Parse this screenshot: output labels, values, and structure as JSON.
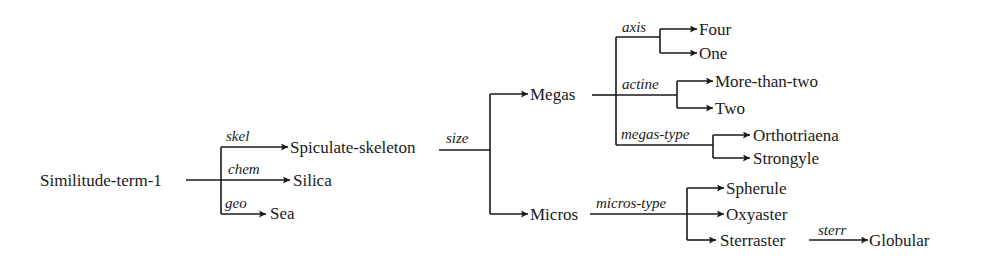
{
  "diagram": {
    "root": "Similitude-term-1",
    "nodes": {
      "root": "Similitude-term-1",
      "spiculate_skeleton": "Spiculate-skeleton",
      "silica": "Silica",
      "sea": "Sea",
      "megas": "Megas",
      "micros": "Micros",
      "four": "Four",
      "one": "One",
      "more_than_two": "More-than-two",
      "two": "Two",
      "orthotriaena": "Orthotriaena",
      "strongyle": "Strongyle",
      "spherule": "Spherule",
      "oxyaster": "Oxyaster",
      "sterraster": "Sterraster",
      "globular": "Globular"
    },
    "edge_labels": {
      "skel": "skel",
      "chem": "chem",
      "geo": "geo",
      "size": "size",
      "axis": "axis",
      "actine": "actine",
      "megas_type": "megas-type",
      "micros_type": "micros-type",
      "sterr": "sterr"
    },
    "edges": [
      {
        "from": "Similitude-term-1",
        "label": "skel",
        "to": "Spiculate-skeleton"
      },
      {
        "from": "Similitude-term-1",
        "label": "chem",
        "to": "Silica"
      },
      {
        "from": "Similitude-term-1",
        "label": "geo",
        "to": "Sea"
      },
      {
        "from": "Spiculate-skeleton",
        "label": "size",
        "to": "Megas"
      },
      {
        "from": "Spiculate-skeleton",
        "label": "size",
        "to": "Micros"
      },
      {
        "from": "Megas",
        "label": "axis",
        "to": "Four"
      },
      {
        "from": "Megas",
        "label": "axis",
        "to": "One"
      },
      {
        "from": "Megas",
        "label": "actine",
        "to": "More-than-two"
      },
      {
        "from": "Megas",
        "label": "actine",
        "to": "Two"
      },
      {
        "from": "Megas",
        "label": "megas-type",
        "to": "Orthotriaena"
      },
      {
        "from": "Megas",
        "label": "megas-type",
        "to": "Strongyle"
      },
      {
        "from": "Micros",
        "label": "micros-type",
        "to": "Spherule"
      },
      {
        "from": "Micros",
        "label": "micros-type",
        "to": "Oxyaster"
      },
      {
        "from": "Micros",
        "label": "micros-type",
        "to": "Sterraster"
      },
      {
        "from": "Sterraster",
        "label": "sterr",
        "to": "Globular"
      }
    ]
  }
}
